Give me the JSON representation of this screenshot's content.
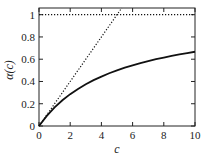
{
  "chart_data": {
    "type": "line",
    "title": "",
    "xlabel": "c",
    "ylabel": "α(c)",
    "xlim": [
      0,
      10
    ],
    "ylim": [
      0,
      1.06
    ],
    "xticks": [
      0,
      2,
      4,
      6,
      8,
      10
    ],
    "xtick_labels": [
      "0",
      "2",
      "4",
      "6",
      "8",
      "10"
    ],
    "yticks": [
      0,
      0.2,
      0.4,
      0.6,
      0.8,
      1
    ],
    "ytick_labels": [
      "0",
      "0.2",
      "0.4",
      "0.6",
      "0.8",
      "1"
    ],
    "grid": false,
    "legend": "none",
    "series": [
      {
        "name": "alpha-curve",
        "style": "solid",
        "x": [
          0,
          0.5,
          1,
          1.5,
          2,
          2.5,
          3,
          3.5,
          4,
          4.5,
          5,
          5.5,
          6,
          6.5,
          7,
          7.5,
          8,
          8.5,
          9,
          9.5,
          10
        ],
        "y": [
          0,
          0.091,
          0.167,
          0.231,
          0.286,
          0.333,
          0.375,
          0.412,
          0.444,
          0.474,
          0.5,
          0.524,
          0.545,
          0.565,
          0.583,
          0.6,
          0.615,
          0.63,
          0.643,
          0.655,
          0.667
        ]
      },
      {
        "name": "linear-asymptote",
        "style": "dotted",
        "x": [
          0,
          5.3
        ],
        "y": [
          0,
          1.06
        ]
      },
      {
        "name": "saturation-line",
        "style": "dotted",
        "x": [
          0,
          10
        ],
        "y": [
          1,
          1
        ]
      }
    ]
  }
}
